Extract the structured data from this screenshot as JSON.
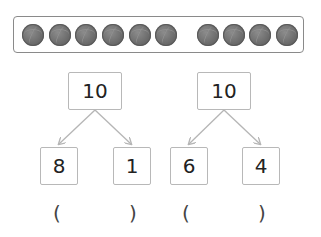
{
  "balls": {
    "group_a_count": 6,
    "group_b_count": 4,
    "color": "#6e6e6e"
  },
  "trees": [
    {
      "top": "10",
      "left": "8",
      "right": "1"
    },
    {
      "top": "10",
      "left": "6",
      "right": "4"
    }
  ],
  "answers": [
    {
      "open": "(",
      "close": ")"
    },
    {
      "open": "(",
      "close": ")"
    }
  ],
  "colors": {
    "box_border": "#b8b8b8",
    "arrow": "#b5b5b5",
    "frame_border": "#8a8a8a"
  }
}
